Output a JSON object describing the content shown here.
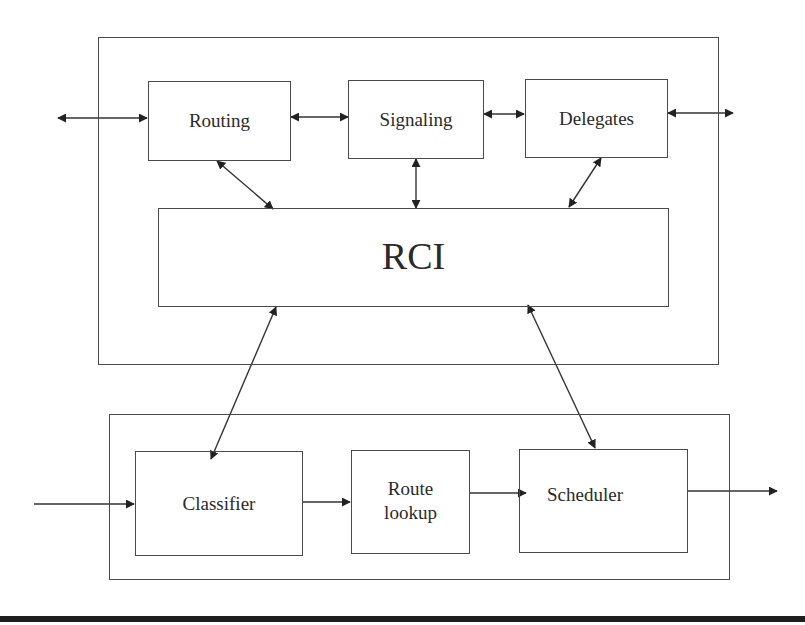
{
  "diagram": {
    "control_plane": {
      "modules": [
        {
          "id": "routing",
          "label": "Routing"
        },
        {
          "id": "signaling",
          "label": "Signaling"
        },
        {
          "id": "delegates",
          "label": "Delegates"
        }
      ],
      "interface": {
        "id": "rci",
        "label": "RCI"
      }
    },
    "data_plane": {
      "modules": [
        {
          "id": "classifier",
          "label": "Classifier"
        },
        {
          "id": "route_lookup",
          "label": "Route\nlookup",
          "line1": "Route",
          "line2": "lookup"
        },
        {
          "id": "scheduler",
          "label": "Scheduler"
        }
      ]
    },
    "connections": [
      {
        "from": "external-left",
        "to": "routing",
        "type": "bidirectional"
      },
      {
        "from": "routing",
        "to": "signaling",
        "type": "bidirectional"
      },
      {
        "from": "signaling",
        "to": "delegates",
        "type": "bidirectional"
      },
      {
        "from": "delegates",
        "to": "external-right",
        "type": "bidirectional"
      },
      {
        "from": "routing",
        "to": "rci",
        "type": "bidirectional"
      },
      {
        "from": "signaling",
        "to": "rci",
        "type": "bidirectional"
      },
      {
        "from": "delegates",
        "to": "rci",
        "type": "bidirectional"
      },
      {
        "from": "rci",
        "to": "classifier",
        "type": "bidirectional"
      },
      {
        "from": "rci",
        "to": "scheduler",
        "type": "bidirectional"
      },
      {
        "from": "input",
        "to": "classifier",
        "type": "directed"
      },
      {
        "from": "classifier",
        "to": "route_lookup",
        "type": "directed"
      },
      {
        "from": "route_lookup",
        "to": "scheduler",
        "type": "directed"
      },
      {
        "from": "scheduler",
        "to": "output",
        "type": "directed"
      }
    ],
    "colors": {
      "stroke": "#4a4a4a",
      "arrow": "#222222",
      "text": "#2a2a2a",
      "rule": "#1e1e1e"
    }
  }
}
